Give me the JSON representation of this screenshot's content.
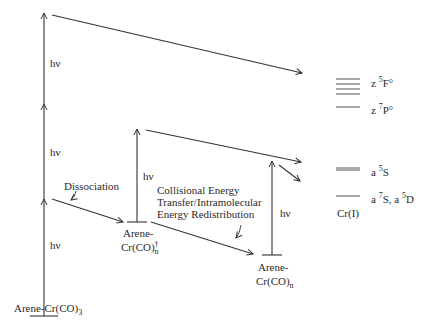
{
  "diagram": {
    "photon_label": "hν",
    "species": {
      "ground": {
        "prefix": "Arene-Cr(CO)",
        "sub": "3"
      },
      "excited": {
        "line1": "Arene-",
        "prefix": "Cr(CO)",
        "sup": "†",
        "sub": "n"
      },
      "relaxed": {
        "line1": "Arene-",
        "prefix": "Cr(CO)",
        "sub": "n"
      }
    },
    "process_labels": {
      "dissociation": "Dissociation",
      "collisional_line1": "Collisional Energy",
      "collisional_line2": "Transfer/Intramolecular",
      "collisional_line3": "Energy Redistribution"
    },
    "levels": {
      "z5F": {
        "prefix": "z ",
        "sup": "5",
        "term": "F°"
      },
      "z7P": {
        "prefix": "z ",
        "sup": "7",
        "term": "P°"
      },
      "a5S": {
        "prefix": "a ",
        "sup": "5",
        "term": "S"
      },
      "a7S_a5D": {
        "prefix1": "a ",
        "sup1": "7",
        "term1": "S, a ",
        "sup2": "5",
        "term2": "D"
      },
      "cr_label": "Cr(I)"
    }
  }
}
